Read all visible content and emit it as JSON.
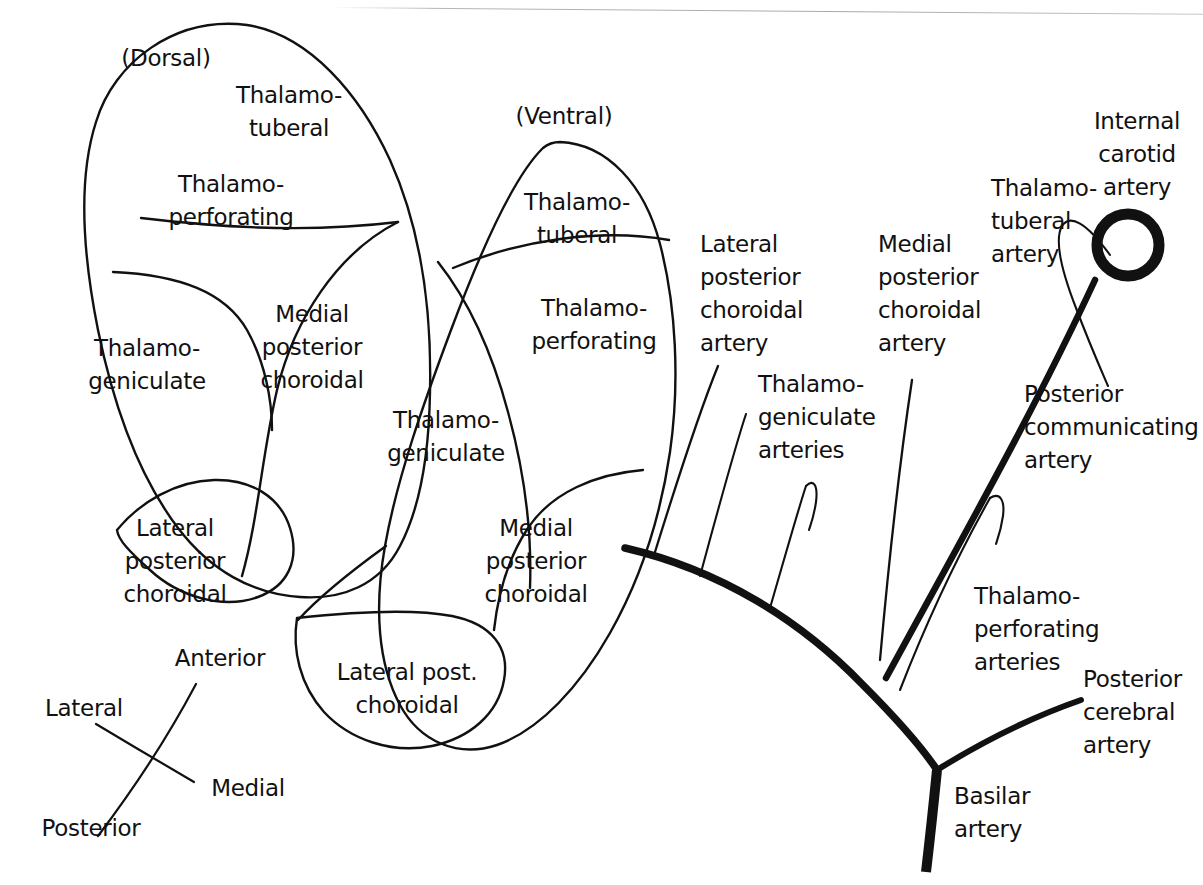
{
  "diagram": {
    "stroke_color": "#111111",
    "background": "#ffffff",
    "orientation_key": {
      "anterior": "Anterior",
      "posterior": "Posterior",
      "lateral": "Lateral",
      "medial": "Medial"
    },
    "panels": [
      {
        "id": "dorsal",
        "caption": "(Dorsal)"
      },
      {
        "id": "ventral",
        "caption": "(Ventral)"
      }
    ],
    "dorsal_territories": [
      {
        "label": "Thalamo-\ntuberal"
      },
      {
        "label": "Thalamo-\nperforating"
      },
      {
        "label": "Thalamo-\ngeniculate"
      },
      {
        "label": "Medial\nposterior\nchoroidal"
      },
      {
        "label": "Lateral\nposterior\nchoroidal"
      }
    ],
    "ventral_territories": [
      {
        "label": "Thalamo-\ntuberal"
      },
      {
        "label": "Thalamo-\nperforating"
      },
      {
        "label": "Thalamo-\ngeniculate"
      },
      {
        "label": "Medial\nposterior\nchoroidal"
      },
      {
        "label": "Lateral post.\nchoroidal"
      }
    ],
    "vessel_labels": [
      {
        "id": "lateral-posterior-choroidal-artery",
        "label": "Lateral\nposterior\nchoroidal\nartery"
      },
      {
        "id": "thalamogeniculate-arteries",
        "label": "Thalamo-\ngeniculate\narteries"
      },
      {
        "id": "medial-posterior-choroidal-artery",
        "label": "Medial\nposterior\nchoroidal\nartery"
      },
      {
        "id": "thalamotuberal-artery",
        "label": "Thalamo-\ntuberal\nartery"
      },
      {
        "id": "internal-carotid-artery",
        "label": "Internal\ncarotid\nartery"
      },
      {
        "id": "posterior-communicating-artery",
        "label": "Posterior\ncommunicating\nartery"
      },
      {
        "id": "thalamoperforating-arteries",
        "label": "Thalamo-\nperforating\narteries"
      },
      {
        "id": "posterior-cerebral-artery",
        "label": "Posterior\ncerebral\nartery"
      },
      {
        "id": "basilar-artery",
        "label": "Basilar\nartery"
      }
    ]
  }
}
